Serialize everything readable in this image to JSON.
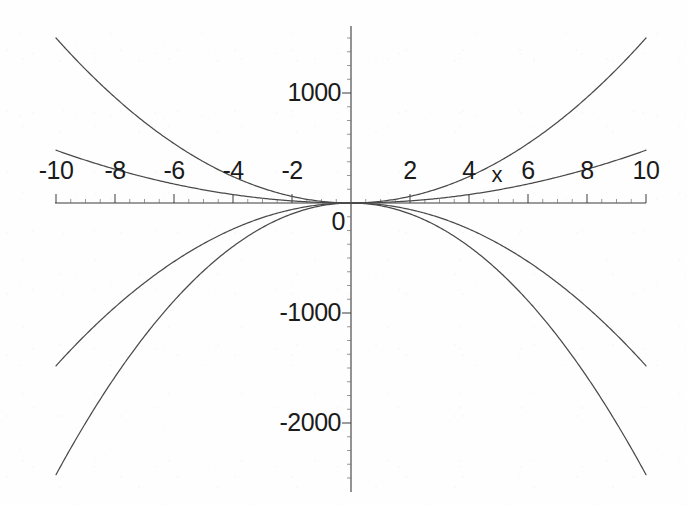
{
  "chart_data": {
    "type": "line",
    "title": "",
    "subtitle": "",
    "xlabel": "x",
    "ylabel": "",
    "xlim": [
      -10,
      10
    ],
    "ylim": [
      -2600,
      1600
    ],
    "grid": false,
    "legend": "none",
    "background_color": "#fefefe",
    "curve_color": "#4a4a4a",
    "axis_color": "#3a3a3a",
    "x_ticks": [
      -10,
      -8,
      -6,
      -4,
      -2,
      2,
      4,
      6,
      8,
      10
    ],
    "x_tick_labels": [
      "-10",
      "-8",
      "-6",
      "-4",
      "-2",
      "2",
      "4",
      "6",
      "8",
      "10"
    ],
    "x_minor_tick_step": 0.5,
    "y_ticks": [
      1000,
      0,
      -1000,
      -2000
    ],
    "y_tick_labels": [
      "1000",
      "0",
      "-1000",
      "-2000"
    ],
    "y_minor_tick_step": 125,
    "origin_label": "0",
    "axis_label_x": "x",
    "series": [
      {
        "name": "steep-upward-parabola",
        "type": "even-power-polynomial",
        "coefficient": 15,
        "exponent": 2,
        "direction": "opens-up",
        "points": [
          {
            "x": -10,
            "y": 1480
          },
          {
            "x": -8,
            "y": 948
          },
          {
            "x": -6,
            "y": 533
          },
          {
            "x": -4,
            "y": 237
          },
          {
            "x": -2,
            "y": 59
          },
          {
            "x": 0,
            "y": 0
          },
          {
            "x": 2,
            "y": 59
          },
          {
            "x": 4,
            "y": 237
          },
          {
            "x": 6,
            "y": 533
          },
          {
            "x": 8,
            "y": 948
          },
          {
            "x": 10,
            "y": 1480
          }
        ]
      },
      {
        "name": "shallow-upward-parabola",
        "type": "even-power-polynomial",
        "coefficient": 4.8,
        "exponent": 2,
        "direction": "opens-up",
        "points": [
          {
            "x": -10,
            "y": 480
          },
          {
            "x": -8,
            "y": 307
          },
          {
            "x": -6,
            "y": 173
          },
          {
            "x": -4,
            "y": 77
          },
          {
            "x": -2,
            "y": 19
          },
          {
            "x": 0,
            "y": 0
          },
          {
            "x": 2,
            "y": 19
          },
          {
            "x": 4,
            "y": 77
          },
          {
            "x": 6,
            "y": 173
          },
          {
            "x": 8,
            "y": 307
          },
          {
            "x": 10,
            "y": 480
          }
        ]
      },
      {
        "name": "shallow-downward-parabola",
        "type": "even-power-polynomial",
        "coefficient": -14.8,
        "exponent": 2,
        "direction": "opens-down",
        "points": [
          {
            "x": -10,
            "y": -1480
          },
          {
            "x": -8,
            "y": -947
          },
          {
            "x": -6,
            "y": -533
          },
          {
            "x": -4,
            "y": -237
          },
          {
            "x": -2,
            "y": -59
          },
          {
            "x": 0,
            "y": 0
          },
          {
            "x": 2,
            "y": -59
          },
          {
            "x": 4,
            "y": -237
          },
          {
            "x": 6,
            "y": -533
          },
          {
            "x": 8,
            "y": -947
          },
          {
            "x": 10,
            "y": -1480
          }
        ]
      },
      {
        "name": "steep-downward-parabola",
        "type": "even-power-polynomial",
        "coefficient": -24.7,
        "exponent": 2,
        "direction": "opens-down",
        "points": [
          {
            "x": -10,
            "y": -2470
          },
          {
            "x": -8,
            "y": -1581
          },
          {
            "x": -6,
            "y": -889
          },
          {
            "x": -4,
            "y": -395
          },
          {
            "x": -2,
            "y": -99
          },
          {
            "x": 0,
            "y": 0
          },
          {
            "x": 2,
            "y": -99
          },
          {
            "x": 4,
            "y": -395
          },
          {
            "x": 6,
            "y": -889
          },
          {
            "x": 8,
            "y": -1581
          },
          {
            "x": 10,
            "y": -2470
          }
        ]
      }
    ]
  }
}
